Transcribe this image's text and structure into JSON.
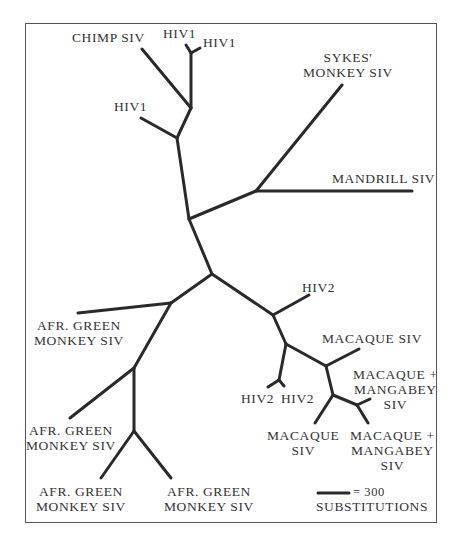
{
  "figure": {
    "type": "unrooted phylogenetic tree",
    "line_color": "#2a2a2a",
    "text_color": "#333333",
    "border_color": "#555555"
  },
  "labels": {
    "chimp_siv": "CHIMP SIV",
    "hiv1_top_a": "HIV1",
    "hiv1_top_b": "HIV1",
    "hiv1_lower": "HIV1",
    "sykes_line1": "SYKES'",
    "sykes_line2": "MONKEY SIV",
    "mandrill_siv": "MANDRILL SIV",
    "hiv2_upper": "HIV2",
    "macaque_siv_upper": "MACAQUE SIV",
    "macaque_mangabey_a_line1": "MACAQUE +",
    "macaque_mangabey_a_line2": "MANGABEY",
    "macaque_mangabey_a_line3": "SIV",
    "hiv2_pair_a": "HIV2",
    "hiv2_pair_b": "HIV2",
    "macaque_lower_line1": "MACAQUE",
    "macaque_lower_line2": "SIV",
    "macaque_mangabey_b_line1": "MACAQUE +",
    "macaque_mangabey_b_line2": "MANGABEY",
    "macaque_mangabey_b_line3": "SIV",
    "agm_1_line1": "AFR. GREEN",
    "agm_1_line2": "MONKEY SIV",
    "agm_2_line1": "AFR. GREEN",
    "agm_2_line2": "MONKEY SIV",
    "agm_3_line1": "AFR. GREEN",
    "agm_3_line2": "MONKEY SIV",
    "agm_4_line1": "AFR. GREEN",
    "agm_4_line2": "MONKEY SIV"
  },
  "scale_bar": {
    "value_label": "= 300",
    "unit_label": "SUBSTITUTIONS",
    "represents": 300
  },
  "tree": {
    "taxa": [
      "CHIMP SIV",
      "HIV1",
      "HIV1",
      "HIV1",
      "SYKES' MONKEY SIV",
      "MANDRILL SIV",
      "HIV2",
      "MACAQUE SIV",
      "MACAQUE + MANGABEY SIV",
      "HIV2",
      "HIV2",
      "MACAQUE SIV",
      "MACAQUE + MANGABEY SIV",
      "AFR. GREEN MONKEY SIV",
      "AFR. GREEN MONKEY SIV",
      "AFR. GREEN MONKEY SIV",
      "AFR. GREEN MONKEY SIV"
    ]
  }
}
